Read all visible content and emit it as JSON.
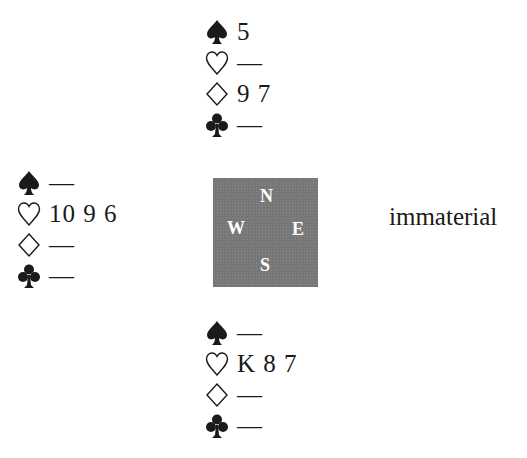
{
  "diagram": {
    "type": "bridge-card-layout",
    "compass": {
      "north": "N",
      "west": "W",
      "east": "E",
      "south": "S"
    },
    "hands": {
      "north": [
        {
          "suit": "spade-icon",
          "cards": "5"
        },
        {
          "suit": "heart-icon",
          "cards": "—"
        },
        {
          "suit": "diamond-icon",
          "cards": "9 7"
        },
        {
          "suit": "club-icon",
          "cards": "—"
        }
      ],
      "west": [
        {
          "suit": "spade-icon",
          "cards": "—"
        },
        {
          "suit": "heart-icon",
          "cards": "10 9 6"
        },
        {
          "suit": "diamond-icon",
          "cards": "—"
        },
        {
          "suit": "club-icon",
          "cards": "—"
        }
      ],
      "east": "immaterial",
      "south": [
        {
          "suit": "spade-icon",
          "cards": "—"
        },
        {
          "suit": "heart-icon",
          "cards": "K 8 7"
        },
        {
          "suit": "diamond-icon",
          "cards": "—"
        },
        {
          "suit": "club-icon",
          "cards": "—"
        }
      ]
    },
    "colors": {
      "table": "#777777",
      "text": "#1a1a1a",
      "compass_text": "#ffffff"
    }
  }
}
